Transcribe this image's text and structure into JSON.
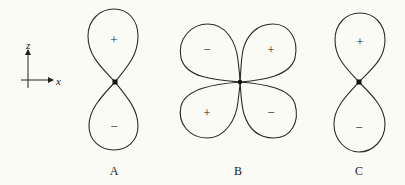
{
  "figure": {
    "axes": {
      "vertical_label": "z",
      "horizontal_label": "x"
    },
    "orbitals": [
      {
        "label": "A",
        "shape": "two-lobe vertical",
        "lobes": [
          {
            "position": "top",
            "sign": "+"
          },
          {
            "position": "bottom",
            "sign": "−"
          }
        ]
      },
      {
        "label": "B",
        "shape": "four-lobe cloverleaf",
        "lobes": [
          {
            "position": "upper-left",
            "sign": "−"
          },
          {
            "position": "upper-right",
            "sign": "+"
          },
          {
            "position": "lower-left",
            "sign": "+"
          },
          {
            "position": "lower-right",
            "sign": "−"
          }
        ]
      },
      {
        "label": "C",
        "shape": "two-lobe vertical",
        "lobes": [
          {
            "position": "top",
            "sign": "+"
          },
          {
            "position": "bottom",
            "sign": "−"
          }
        ]
      }
    ]
  }
}
